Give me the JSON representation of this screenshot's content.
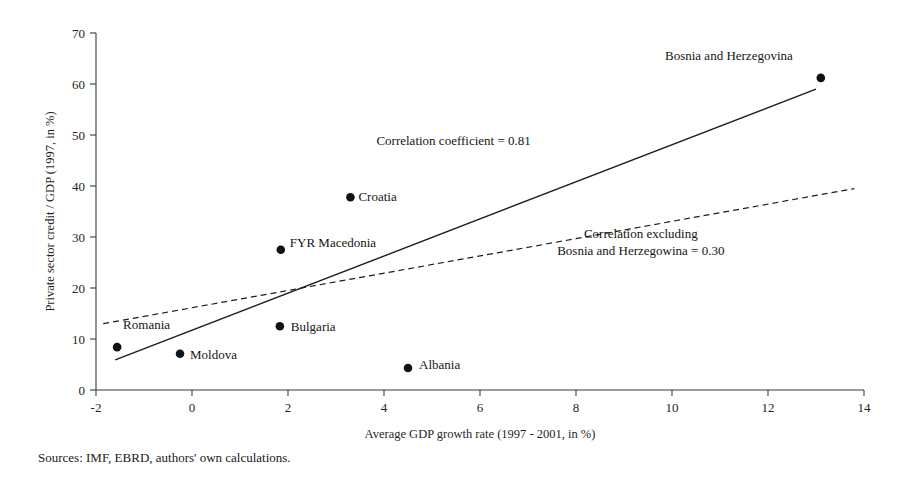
{
  "source_note": "Sources: IMF, EBRD, authors' own calculations.",
  "chart_data": {
    "type": "scatter",
    "title": "",
    "xlabel": "Average GDP growth rate (1997 - 2001, in %)",
    "ylabel": "Private sector credit / GDP (1997, in %)",
    "xlim": [
      -2,
      14
    ],
    "ylim": [
      0,
      70
    ],
    "xticks": [
      -2,
      0,
      2,
      4,
      6,
      8,
      10,
      12,
      14
    ],
    "yticks": [
      0,
      10,
      20,
      30,
      40,
      50,
      60,
      70
    ],
    "xtick_labels": [
      "-2",
      "0",
      "2",
      "4",
      "6",
      "8",
      "10",
      "12",
      "14"
    ],
    "ytick_labels": [
      "0",
      "10",
      "20",
      "30",
      "40",
      "50",
      "60",
      "70"
    ],
    "grid": false,
    "legend": "none",
    "points": [
      {
        "label": "Romania",
        "x": -1.56,
        "y": 8.4,
        "label_dx": 6,
        "label_dy": -18,
        "anchor": "start"
      },
      {
        "label": "Moldova",
        "x": -0.25,
        "y": 7.1,
        "label_dx": 10,
        "label_dy": 5,
        "anchor": "start"
      },
      {
        "label": "Bulgaria",
        "x": 1.83,
        "y": 12.5,
        "label_dx": 11,
        "label_dy": 5,
        "anchor": "start"
      },
      {
        "label": "FYR Macedonia",
        "x": 1.85,
        "y": 27.5,
        "label_dx": 9,
        "label_dy": -3,
        "anchor": "start"
      },
      {
        "label": "Croatia",
        "x": 3.3,
        "y": 37.8,
        "label_dx": 8,
        "label_dy": 4,
        "anchor": "start"
      },
      {
        "label": "Albania",
        "x": 4.5,
        "y": 4.3,
        "label_dx": 11,
        "label_dy": 1,
        "anchor": "start"
      },
      {
        "label": "Bosnia and Herzegovina",
        "x": 13.1,
        "y": 61.2,
        "label_dx": -28,
        "label_dy": -18,
        "anchor": "end"
      }
    ],
    "trendlines": [
      {
        "name": "correlation-including-bosnia",
        "style": "solid",
        "x0": -1.6,
        "y0": 5.9,
        "x1": 13.0,
        "y1": 59.0
      },
      {
        "name": "correlation-excluding-bosnia",
        "style": "dashed",
        "x0": -1.85,
        "y0": 13.0,
        "x1": 13.8,
        "y1": 39.5
      }
    ],
    "annotations": [
      {
        "name": "correlation-coefficient-all",
        "lines": [
          "Correlation coefficient = 0.81"
        ],
        "x": 5.45,
        "y": 48.0
      },
      {
        "name": "correlation-coefficient-excluding",
        "lines": [
          "Correlation excluding",
          "Bosnia and Herzegowina = 0.30"
        ],
        "x": 9.35,
        "y": 29.8
      }
    ]
  }
}
